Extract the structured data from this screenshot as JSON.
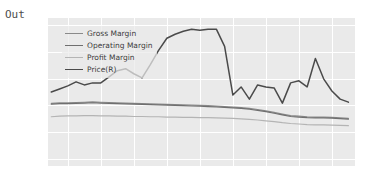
{
  "notebook": {
    "output_prompt": "Out"
  },
  "chart_data": {
    "type": "line",
    "title": "",
    "xlabel": "",
    "ylabel": "",
    "grid": true,
    "legend_position": "upper left",
    "x_tick_labels": [
      "2013",
      "2014",
      "2015",
      "2016",
      "2017",
      "2018",
      "2019",
      "2020",
      "2021"
    ],
    "x": [
      2012.5,
      2012.75,
      2013.0,
      2013.25,
      2013.5,
      2013.75,
      2014.0,
      2014.25,
      2014.5,
      2014.75,
      2015.0,
      2015.25,
      2015.5,
      2015.75,
      2016.0,
      2016.25,
      2016.5,
      2016.75,
      2017.0,
      2017.25,
      2017.5,
      2017.75,
      2018.0,
      2018.25,
      2018.5,
      2018.75,
      2019.0,
      2019.25,
      2019.5,
      2019.75,
      2020.0,
      2020.25,
      2020.5,
      2020.75,
      2021.0,
      2021.25,
      2021.5
    ],
    "xlim": [
      2012.4,
      2021.7
    ],
    "left_axis": {
      "label": "",
      "ylim": [
        -0.125,
        0.425
      ],
      "ticks": [
        -0.1,
        0.0,
        0.1,
        0.2,
        0.3,
        0.4
      ],
      "tick_labels": [
        "-0.1",
        "0.0",
        "0.1",
        "0.2",
        "0.3",
        "0.4"
      ]
    },
    "right_axis": {
      "label": "",
      "ylim": [
        5,
        78
      ],
      "ticks": [
        10,
        20,
        30,
        40,
        50,
        60,
        70
      ],
      "tick_labels": [
        "10",
        "20",
        "30",
        "40",
        "50",
        "60",
        "70"
      ]
    },
    "series": [
      {
        "name": "Gross Margin",
        "axis": "left",
        "color": "#8a8a8a",
        "width": 1.2,
        "values": [
          0.108,
          0.11,
          0.11,
          0.111,
          0.112,
          0.113,
          0.112,
          0.111,
          0.11,
          0.109,
          0.108,
          0.107,
          0.106,
          0.105,
          0.104,
          0.103,
          0.102,
          0.101,
          0.1,
          0.099,
          0.098,
          0.096,
          0.094,
          0.092,
          0.089,
          0.085,
          0.08,
          0.074,
          0.068,
          0.062,
          0.06,
          0.058,
          0.057,
          0.057,
          0.056,
          0.054,
          0.052
        ]
      },
      {
        "name": "Operating Margin",
        "axis": "left",
        "color": "#6f6f6f",
        "width": 1.2,
        "values": [
          0.105,
          0.107,
          0.107,
          0.108,
          0.109,
          0.11,
          0.109,
          0.108,
          0.107,
          0.106,
          0.105,
          0.104,
          0.103,
          0.102,
          0.101,
          0.1,
          0.099,
          0.098,
          0.097,
          0.096,
          0.095,
          0.093,
          0.091,
          0.089,
          0.086,
          0.082,
          0.077,
          0.071,
          0.065,
          0.059,
          0.057,
          0.055,
          0.054,
          0.054,
          0.053,
          0.051,
          0.049
        ]
      },
      {
        "name": "Profit Margin",
        "axis": "left",
        "color": "#b4b4b4",
        "width": 1.2,
        "values": [
          0.058,
          0.06,
          0.061,
          0.061,
          0.062,
          0.062,
          0.061,
          0.061,
          0.06,
          0.06,
          0.059,
          0.059,
          0.058,
          0.058,
          0.057,
          0.057,
          0.056,
          0.056,
          0.055,
          0.055,
          0.054,
          0.053,
          0.052,
          0.05,
          0.048,
          0.046,
          0.043,
          0.04,
          0.036,
          0.033,
          0.031,
          0.029,
          0.028,
          0.028,
          0.027,
          0.026,
          0.025
        ]
      },
      {
        "name": "Price(R)",
        "axis": "right",
        "color": "#4a4a4a",
        "width": 1.5,
        "values": [
          41.5,
          43.0,
          44.5,
          46.5,
          45.0,
          46.0,
          46.0,
          49.0,
          52.0,
          53.0,
          50.5,
          48.5,
          55.0,
          62.0,
          68.0,
          70.0,
          71.5,
          72.5,
          72.0,
          72.5,
          72.5,
          64.0,
          40.0,
          44.0,
          38.0,
          45.0,
          44.0,
          43.5,
          36.0,
          46.0,
          47.0,
          44.0,
          58.0,
          48.0,
          42.0,
          38.0,
          36.5
        ]
      }
    ],
    "annotations": []
  },
  "legend": {
    "entries": [
      {
        "label": "Gross Margin"
      },
      {
        "label": "Operating Margin"
      },
      {
        "label": "Profit Margin"
      },
      {
        "label": "Price(R)"
      }
    ]
  }
}
